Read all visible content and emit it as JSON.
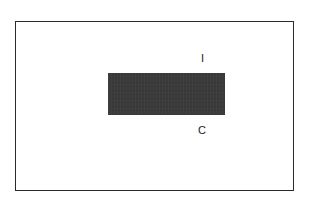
{
  "diagram": {
    "frame": {
      "border_color": "#2a2a2a",
      "background": "#ffffff"
    },
    "block": {
      "fill_color": "#3a3a3a"
    },
    "labels": {
      "top": "I",
      "bottom": "C"
    }
  }
}
